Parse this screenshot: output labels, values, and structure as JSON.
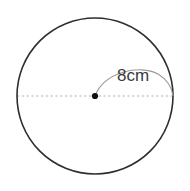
{
  "figure": {
    "name": "circle-radius-diagram",
    "background_color": "#ffffff",
    "width": 190,
    "height": 191
  },
  "circle": {
    "center_x": 95,
    "center_y": 96,
    "radius_px": 78,
    "stroke_color": "#2e2e2e",
    "stroke_width": 1.6,
    "fill": "none"
  },
  "diameter_line": {
    "label": "diameter-dashed-line",
    "x1": 17,
    "y1": 96,
    "x2": 173,
    "y2": 96,
    "stroke_color": "#b6b6b6",
    "stroke_width": 1.1,
    "dash_pattern": "2.4 2.4"
  },
  "center_point": {
    "label": "center-point",
    "cx": 95,
    "cy": 96,
    "r": 3.1,
    "fill_color": "#111111"
  },
  "leader_arc": {
    "label": "radius-leader-arc",
    "path": "M 95 96 C 104 72, 140 64, 158 74 C 168 80, 172 88, 173 96",
    "stroke_color": "#9a9a9a",
    "stroke_width": 1.1,
    "fill": "none"
  },
  "annotations": [
    {
      "name": "radius-measure-label",
      "text": "8cm",
      "x": 117,
      "y": 81,
      "color": "#3a3a3a",
      "font_size": 17
    }
  ]
}
